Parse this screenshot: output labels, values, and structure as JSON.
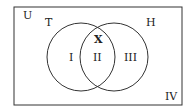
{
  "diagram": {
    "type": "venn",
    "universe_label": "U",
    "sets": [
      {
        "label": "T"
      },
      {
        "label": "H"
      }
    ],
    "regions": {
      "only_T": "I",
      "intersection": "II",
      "only_H": "III",
      "outside": "IV",
      "intersection_marker": "X"
    },
    "colors": {
      "stroke": "#333333",
      "background": "#ffffff"
    }
  }
}
